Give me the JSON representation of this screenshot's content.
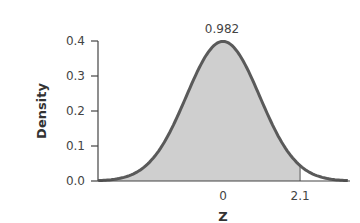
{
  "chart_data": {
    "type": "area",
    "title": "",
    "xlabel": "Z",
    "ylabel": "Density",
    "distribution": "standard normal",
    "xlim": [
      -3.4,
      3.4
    ],
    "ylim": [
      0.0,
      0.4
    ],
    "yticks": [
      "0.0",
      "0.1",
      "0.2",
      "0.3",
      "0.4"
    ],
    "xticks": [
      "0",
      "2.1"
    ],
    "shaded_region": {
      "from": "-inf",
      "to": 2.1,
      "fill": "#cfcfcf"
    },
    "annotation": {
      "text": "0.982",
      "position": "above peak"
    },
    "curve_color": "#555555",
    "grid": false,
    "legend": null
  }
}
